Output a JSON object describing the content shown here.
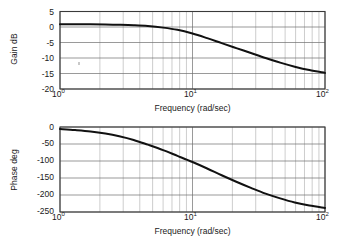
{
  "figure": {
    "type": "bode-plot-pair",
    "background": "#ffffff",
    "curve_color": "#111111",
    "grid_major_color": "#6e6e6e",
    "grid_minor_color": "#9a9a9a",
    "frame_color": "#3a3a3a"
  },
  "chart_data": [
    {
      "type": "line",
      "id": "gain-plot",
      "title": "",
      "xlabel": "Frequency (rad/sec)",
      "ylabel": "Gain dB",
      "xscale": "log",
      "xlim": [
        1,
        100
      ],
      "ylim": [
        -20,
        5
      ],
      "grid": true,
      "legend": "none",
      "xticks": [
        1,
        10,
        100
      ],
      "xticklabels": [
        "10^0",
        "10^1",
        "10^2"
      ],
      "yticks": [
        5,
        0,
        -5,
        -10,
        -15,
        -20
      ],
      "yticklabels": [
        "5",
        "0",
        "-5",
        "-10",
        "-15",
        "-20"
      ],
      "x": [
        1.0,
        1.3,
        1.7,
        2.2,
        2.8,
        3.6,
        4.6,
        6.0,
        7.7,
        10.0,
        12.9,
        16.6,
        21.4,
        27.6,
        35.6,
        45.9,
        59.1,
        76.2,
        100.0
      ],
      "values": [
        0.9,
        0.9,
        0.85,
        0.8,
        0.7,
        0.55,
        0.3,
        -0.2,
        -0.9,
        -2.1,
        -3.6,
        -5.2,
        -6.8,
        -8.4,
        -10.0,
        -11.5,
        -12.8,
        -13.9,
        -14.8
      ]
    },
    {
      "type": "line",
      "id": "phase-plot",
      "title": "",
      "xlabel": "Frequency (rad/sec)",
      "ylabel": "Phase deg",
      "xscale": "log",
      "xlim": [
        1,
        100
      ],
      "ylim": [
        -250,
        0
      ],
      "grid": true,
      "legend": "none",
      "xticks": [
        1,
        10,
        100
      ],
      "xticklabels": [
        "10^0",
        "10^1",
        "10^2"
      ],
      "yticks": [
        0,
        -50,
        -100,
        -150,
        -200,
        -250
      ],
      "yticklabels": [
        "0",
        "-50",
        "-100",
        "-150",
        "-200",
        "-250"
      ],
      "x": [
        1.0,
        1.3,
        1.7,
        2.2,
        2.8,
        3.6,
        4.6,
        6.0,
        7.7,
        10.0,
        12.9,
        16.6,
        21.4,
        27.6,
        35.6,
        45.9,
        59.1,
        76.2,
        100.0
      ],
      "values": [
        -6,
        -9,
        -13,
        -19,
        -27,
        -38,
        -52,
        -68,
        -85,
        -103,
        -122,
        -142,
        -161,
        -179,
        -196,
        -210,
        -222,
        -231,
        -238
      ]
    }
  ],
  "gain": {
    "ylabel": "Gain dB",
    "xlabel": "Frequency (rad/sec)",
    "yticks": [
      "5",
      "0",
      "-5",
      "-10",
      "-15",
      "-20"
    ],
    "xticks": [
      {
        "mantissa": "10",
        "exponent": "0"
      },
      {
        "mantissa": "10",
        "exponent": "1"
      },
      {
        "mantissa": "10",
        "exponent": "2"
      }
    ]
  },
  "phase": {
    "ylabel": "Phase deg",
    "xlabel": "Frequency (rad/sec)",
    "yticks": [
      "0",
      "-50",
      "-100",
      "-150",
      "-200",
      "-250"
    ],
    "xticks": [
      {
        "mantissa": "10",
        "exponent": "0"
      },
      {
        "mantissa": "10",
        "exponent": "1"
      },
      {
        "mantissa": "10",
        "exponent": "2"
      }
    ]
  }
}
